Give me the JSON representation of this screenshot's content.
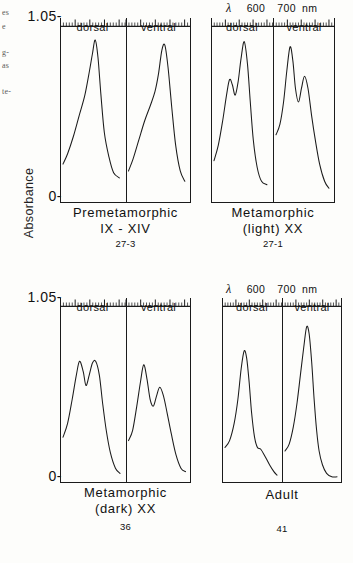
{
  "figure": {
    "y_axis_title": "Absorbance",
    "y_ticks": {
      "top": "1.05-",
      "bottom": "0-"
    },
    "x_axis_header": {
      "symbol": "λ",
      "tick_600": "600",
      "tick_700": "700",
      "unit": "nm"
    }
  },
  "margin_fragments": [
    {
      "text": "es",
      "top": 8
    },
    {
      "text": "e",
      "top": 22
    },
    {
      "text": "g-",
      "top": 48
    },
    {
      "text": "as",
      "top": 61
    },
    {
      "text": "te-",
      "top": 87
    }
  ],
  "panels": [
    {
      "id": "premetamorphic",
      "caption_line1": "Premetamorphic",
      "caption_line2": "IX - XIV",
      "caption_line3": "27-3",
      "halves": [
        {
          "id": "dorsal",
          "label": "dorsal"
        },
        {
          "id": "ventral",
          "label": "ventral"
        }
      ]
    },
    {
      "id": "metamorphic-light",
      "caption_line1": "Metamorphic",
      "caption_line2": "(light) XX",
      "caption_line3": "27-1",
      "halves": [
        {
          "id": "dorsal",
          "label": "dorsal"
        },
        {
          "id": "ventral",
          "label": "ventral"
        }
      ]
    },
    {
      "id": "metamorphic-dark",
      "caption_line1": "Metamorphic",
      "caption_line2": "(dark)  XX",
      "caption_line3": "36",
      "halves": [
        {
          "id": "dorsal",
          "label": "dorsal"
        },
        {
          "id": "ventral",
          "label": "ventral"
        }
      ]
    },
    {
      "id": "adult",
      "caption_line1": "Adult",
      "caption_line2": "",
      "caption_line3": "41",
      "halves": [
        {
          "id": "dorsal",
          "label": "dorsal"
        },
        {
          "id": "ventral",
          "label": "ventral"
        }
      ]
    }
  ],
  "chart_data": {
    "type": "line",
    "xlabel": "λ (nm)",
    "ylabel": "Absorbance",
    "ylim": [
      0,
      1.05
    ],
    "xlim": [
      500,
      750
    ],
    "x_tick_labels": [
      "600",
      "700"
    ],
    "grid": false,
    "legend": "none",
    "note": "Each panel contains two side-by-side spectra traces (dorsal, ventral) sharing a common absorbance scale of 0 to 1.05. Values below are absorbance estimated from the traced curves at the listed wavelengths in nm.",
    "panels": [
      {
        "name": "Premetamorphic IX - XIV",
        "specimen": "27-3",
        "series": [
          {
            "name": "dorsal",
            "x": [
              500,
              520,
              545,
              570,
              595,
              615,
              628,
              640,
              652,
              665,
              680,
              700,
              720,
              745
            ],
            "values": [
              0.22,
              0.28,
              0.38,
              0.5,
              0.62,
              0.76,
              0.86,
              0.94,
              0.84,
              0.62,
              0.4,
              0.26,
              0.17,
              0.14
            ]
          },
          {
            "name": "ventral",
            "x": [
              500,
              520,
              545,
              570,
              595,
              615,
              630,
              645,
              658,
              672,
              688,
              705,
              725,
              745
            ],
            "values": [
              0.18,
              0.25,
              0.36,
              0.47,
              0.56,
              0.64,
              0.74,
              0.88,
              0.91,
              0.78,
              0.55,
              0.33,
              0.18,
              0.12
            ]
          }
        ]
      },
      {
        "name": "Metamorphic (light) XX",
        "specimen": "27-1",
        "series": [
          {
            "name": "dorsal",
            "x": [
              500,
              520,
              540,
              558,
              572,
              585,
              598,
              612,
              625,
              640,
              655,
              668,
              682,
              700,
              720,
              745
            ],
            "values": [
              0.24,
              0.33,
              0.47,
              0.62,
              0.71,
              0.68,
              0.62,
              0.7,
              0.83,
              0.93,
              0.8,
              0.58,
              0.36,
              0.2,
              0.12,
              0.1
            ]
          },
          {
            "name": "ventral",
            "x": [
              500,
              518,
              535,
              550,
              565,
              578,
              590,
              604,
              618,
              632,
              648,
              665,
              682,
              702,
              725,
              745
            ],
            "values": [
              0.39,
              0.45,
              0.58,
              0.76,
              0.9,
              0.82,
              0.66,
              0.58,
              0.66,
              0.73,
              0.66,
              0.5,
              0.36,
              0.22,
              0.12,
              0.08
            ]
          }
        ]
      },
      {
        "name": "Metamorphic (dark) XX",
        "specimen": "36",
        "series": [
          {
            "name": "dorsal",
            "x": [
              500,
              520,
              540,
              558,
              572,
              588,
              600,
              614,
              628,
              642,
              658,
              672,
              688,
              706,
              728,
              748
            ],
            "values": [
              0.26,
              0.34,
              0.48,
              0.62,
              0.7,
              0.64,
              0.56,
              0.62,
              0.69,
              0.7,
              0.62,
              0.46,
              0.3,
              0.17,
              0.08,
              0.05
            ]
          },
          {
            "name": "ventral",
            "x": [
              500,
              518,
              536,
              552,
              566,
              580,
              594,
              608,
              622,
              636,
              652,
              668,
              686,
              706,
              728,
              748
            ],
            "values": [
              0.24,
              0.3,
              0.44,
              0.58,
              0.68,
              0.6,
              0.48,
              0.44,
              0.5,
              0.55,
              0.5,
              0.4,
              0.28,
              0.16,
              0.08,
              0.06
            ]
          }
        ]
      },
      {
        "name": "Adult",
        "specimen": "41",
        "series": [
          {
            "name": "dorsal",
            "x": [
              500,
              522,
              544,
              562,
              578,
              592,
              604,
              616,
              628,
              642,
              656,
              672,
              692,
              714,
              735,
              750
            ],
            "values": [
              0.2,
              0.24,
              0.34,
              0.48,
              0.66,
              0.76,
              0.72,
              0.58,
              0.4,
              0.26,
              0.2,
              0.19,
              0.15,
              0.1,
              0.06,
              0.04
            ]
          },
          {
            "name": "ventral",
            "x": [
              500,
              520,
              540,
              558,
              574,
              590,
              604,
              616,
              628,
              640,
              652,
              664,
              680,
              700,
              725,
              750
            ],
            "values": [
              0.18,
              0.22,
              0.32,
              0.46,
              0.62,
              0.78,
              0.9,
              0.86,
              0.7,
              0.48,
              0.3,
              0.18,
              0.1,
              0.05,
              0.03,
              0.03
            ]
          }
        ]
      }
    ]
  }
}
